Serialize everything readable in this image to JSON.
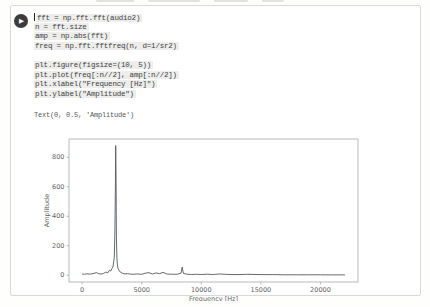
{
  "cell": {
    "run_button": {
      "icon": "play-icon",
      "glyph": "▶"
    },
    "code_lines": [
      "fft = np.fft.fft(audio2)",
      "n = fft.size",
      "amp = np.abs(fft)",
      "freq = np.fft.fftfreq(n, d=1/sr2)",
      "",
      "plt.figure(figsize=(10, 5))",
      "plt.plot(freq[:n//2], amp[:n//2])",
      "plt.xlabel(\"Frequency [Hz]\")",
      "plt.ylabel(\"Amplitude\")"
    ],
    "output_text": "Text(0, 0.5, 'Amplitude')"
  },
  "colors": {
    "cell_border": "#d9d9d6",
    "code_highlight": "#ededeb",
    "code_text": "#3d3f42",
    "axis_frame": "#a8a8a8",
    "tick_text": "#5f6368",
    "spectrum_line": "#55585c",
    "run_button_bg": "#3c3c3c"
  },
  "chart_data": {
    "type": "line",
    "title": "",
    "xlabel": "Frequency [Hz]",
    "ylabel": "Amplitude",
    "xlim": [
      -1100,
      23150
    ],
    "ylim": [
      -46,
      924
    ],
    "xticks": [
      0,
      5000,
      10000,
      15000,
      20000
    ],
    "yticks": [
      0,
      200,
      400,
      600,
      800
    ],
    "grid": false,
    "legend": "none",
    "points": [
      [
        0,
        8
      ],
      [
        200,
        6
      ],
      [
        400,
        10
      ],
      [
        600,
        7
      ],
      [
        800,
        9
      ],
      [
        1000,
        12
      ],
      [
        1200,
        18
      ],
      [
        1400,
        10
      ],
      [
        1600,
        8
      ],
      [
        1800,
        12
      ],
      [
        2000,
        22
      ],
      [
        2150,
        15
      ],
      [
        2300,
        35
      ],
      [
        2400,
        28
      ],
      [
        2500,
        45
      ],
      [
        2600,
        62
      ],
      [
        2700,
        120
      ],
      [
        2750,
        300
      ],
      [
        2790,
        600
      ],
      [
        2820,
        880
      ],
      [
        2850,
        620
      ],
      [
        2880,
        260
      ],
      [
        2920,
        120
      ],
      [
        2960,
        70
      ],
      [
        3000,
        48
      ],
      [
        3080,
        35
      ],
      [
        3200,
        22
      ],
      [
        3400,
        13
      ],
      [
        3600,
        9
      ],
      [
        3800,
        11
      ],
      [
        4000,
        8
      ],
      [
        4300,
        6
      ],
      [
        4600,
        9
      ],
      [
        5000,
        6
      ],
      [
        5300,
        14
      ],
      [
        5600,
        18
      ],
      [
        5900,
        8
      ],
      [
        6200,
        16
      ],
      [
        6500,
        10
      ],
      [
        6800,
        20
      ],
      [
        7100,
        8
      ],
      [
        7500,
        6
      ],
      [
        8000,
        7
      ],
      [
        8300,
        14
      ],
      [
        8400,
        55
      ],
      [
        8500,
        12
      ],
      [
        8800,
        7
      ],
      [
        9200,
        5
      ],
      [
        9600,
        6
      ],
      [
        10000,
        5
      ],
      [
        10500,
        7
      ],
      [
        11000,
        5
      ],
      [
        11500,
        8
      ],
      [
        12000,
        6
      ],
      [
        12500,
        5
      ],
      [
        13000,
        4
      ],
      [
        13900,
        6
      ],
      [
        15000,
        4
      ],
      [
        16000,
        4
      ],
      [
        17000,
        3
      ],
      [
        18000,
        3
      ],
      [
        19000,
        3
      ],
      [
        20000,
        3
      ],
      [
        21000,
        2
      ],
      [
        22050,
        2
      ]
    ]
  }
}
